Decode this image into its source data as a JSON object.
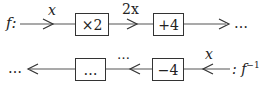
{
  "top_row": {
    "function_label": "f:",
    "input_label": "x",
    "box1": "×2",
    "mid_label": "2x",
    "box2": "+4",
    "trailing": "…"
  },
  "bottom_row": {
    "leading": "…",
    "box1": "…",
    "mid_label": "…",
    "box2": "−4",
    "input_label": "x",
    "function_label": ": f",
    "function_superscript": "−1"
  }
}
